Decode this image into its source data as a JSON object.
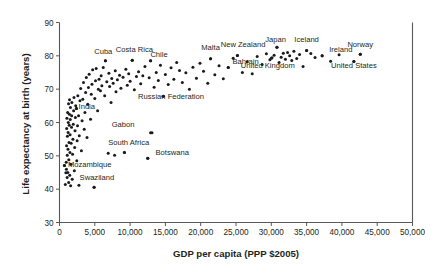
{
  "chart_data": {
    "type": "scatter",
    "title": "",
    "xlabel": "GDP per capita (PPP $2005)",
    "ylabel": "Life expectancy at birth (years)",
    "xlim": [
      0,
      50000
    ],
    "ylim": [
      30,
      90
    ],
    "grid": false,
    "legend": "none",
    "xticks": [
      "0",
      "5,000",
      "10,000",
      "15,000",
      "20,000",
      "25,000",
      "30,000",
      "35,000",
      "40,000",
      "45,000",
      "50,000"
    ],
    "xtickvalues": [
      0,
      5000,
      10000,
      15000,
      20000,
      25000,
      30000,
      35000,
      40000,
      45000,
      50000
    ],
    "yticks": [
      "30",
      "40",
      "50",
      "60",
      "70",
      "80",
      "90"
    ],
    "ytickvalues": [
      30,
      40,
      50,
      60,
      70,
      80,
      90
    ],
    "annotations": [
      {
        "label": "Cuba",
        "x": 6500,
        "y": 78.5,
        "lx": 6200,
        "ly": 80.6,
        "anchor": "middle"
      },
      {
        "label": "Costa Rica",
        "x": 10300,
        "y": 78.7,
        "lx": 10600,
        "ly": 81.3,
        "anchor": "middle"
      },
      {
        "label": "Chile",
        "x": 12900,
        "y": 78.5,
        "lx": 14100,
        "ly": 79.7,
        "anchor": "middle"
      },
      {
        "label": "Malta",
        "x": 21400,
        "y": 79.1,
        "lx": 21400,
        "ly": 81.8,
        "anchor": "middle"
      },
      {
        "label": "New Zealand",
        "x": 25200,
        "y": 80.1,
        "lx": 26000,
        "ly": 82.6,
        "anchor": "middle"
      },
      {
        "label": "Japan",
        "x": 30800,
        "y": 82.6,
        "lx": 30600,
        "ly": 84.3,
        "anchor": "middle"
      },
      {
        "label": "Iceland",
        "x": 35000,
        "y": 81.6,
        "lx": 35000,
        "ly": 84.3,
        "anchor": "middle"
      },
      {
        "label": "Ireland",
        "x": 37200,
        "y": 80.0,
        "lx": 38200,
        "ly": 81.3,
        "anchor": "start"
      },
      {
        "label": "Norway",
        "x": 42600,
        "y": 80.5,
        "lx": 42600,
        "ly": 82.7,
        "anchor": "middle"
      },
      {
        "label": "Bahrain",
        "x": 23900,
        "y": 76.5,
        "lx": 24500,
        "ly": 77.6,
        "anchor": "start"
      },
      {
        "label": "United Kingdom",
        "x": 30000,
        "y": 79.3,
        "lx": 29500,
        "ly": 76.3,
        "anchor": "middle"
      },
      {
        "label": "United States",
        "x": 41700,
        "y": 78.3,
        "lx": 41700,
        "ly": 76.3,
        "anchor": "middle"
      },
      {
        "label": "Russian Federation",
        "x": 14700,
        "y": 67.9,
        "lx": 15800,
        "ly": 67.0,
        "anchor": "middle"
      },
      {
        "label": "India",
        "x": 2400,
        "y": 64.2,
        "lx": 2700,
        "ly": 64.0,
        "anchor": "start"
      },
      {
        "label": "Gabon",
        "x": 12900,
        "y": 56.9,
        "lx": 9000,
        "ly": 58.7,
        "anchor": "middle"
      },
      {
        "label": "South Africa",
        "x": 9200,
        "y": 51.0,
        "lx": 9800,
        "ly": 53.3,
        "anchor": "middle"
      },
      {
        "label": "Botswana",
        "x": 12500,
        "y": 49.3,
        "lx": 13600,
        "ly": 50.3,
        "anchor": "start"
      },
      {
        "label": "Mozambique",
        "x": 700,
        "y": 47.1,
        "lx": 1200,
        "ly": 46.8,
        "anchor": "start"
      },
      {
        "label": "Swaziland",
        "x": 4900,
        "y": 40.6,
        "lx": 5300,
        "ly": 42.7,
        "anchor": "middle"
      }
    ],
    "points": [
      [
        700,
        47.1
      ],
      [
        820,
        41.4
      ],
      [
        900,
        44.9
      ],
      [
        950,
        48.1
      ],
      [
        980,
        46.0
      ],
      [
        1000,
        53.0
      ],
      [
        1020,
        58.2
      ],
      [
        1050,
        61.3
      ],
      [
        1080,
        43.5
      ],
      [
        1100,
        50.2
      ],
      [
        1120,
        55.9
      ],
      [
        1150,
        63.0
      ],
      [
        1180,
        45.0
      ],
      [
        1200,
        52.0
      ],
      [
        1220,
        57.0
      ],
      [
        1250,
        60.0
      ],
      [
        1280,
        65.6
      ],
      [
        1300,
        42.0
      ],
      [
        1320,
        48.8
      ],
      [
        1350,
        54.0
      ],
      [
        1380,
        59.2
      ],
      [
        1400,
        62.5
      ],
      [
        1420,
        66.8
      ],
      [
        1450,
        44.2
      ],
      [
        1480,
        51.0
      ],
      [
        1500,
        56.3
      ],
      [
        1520,
        60.9
      ],
      [
        1550,
        64.5
      ],
      [
        1580,
        41.0
      ],
      [
        1600,
        47.5
      ],
      [
        1650,
        53.8
      ],
      [
        1700,
        58.6
      ],
      [
        1720,
        62.0
      ],
      [
        1750,
        66.0
      ],
      [
        1800,
        43.0
      ],
      [
        1850,
        50.5
      ],
      [
        1900,
        55.0
      ],
      [
        1950,
        59.5
      ],
      [
        2000,
        63.5
      ],
      [
        2050,
        67.5
      ],
      [
        2100,
        45.5
      ],
      [
        2150,
        52.5
      ],
      [
        2200,
        57.5
      ],
      [
        2250,
        61.5
      ],
      [
        2300,
        65.0
      ],
      [
        2400,
        64.2
      ],
      [
        2450,
        48.5
      ],
      [
        2500,
        54.5
      ],
      [
        2550,
        59.0
      ],
      [
        2600,
        68.0
      ],
      [
        2700,
        62.0
      ],
      [
        2750,
        41.2
      ],
      [
        2800,
        56.0
      ],
      [
        2900,
        66.5
      ],
      [
        3000,
        70.2
      ],
      [
        3100,
        51.5
      ],
      [
        3200,
        60.5
      ],
      [
        3300,
        67.0
      ],
      [
        3400,
        72.0
      ],
      [
        3500,
        58.0
      ],
      [
        3600,
        63.0
      ],
      [
        3700,
        69.0
      ],
      [
        3800,
        73.5
      ],
      [
        3900,
        55.5
      ],
      [
        4000,
        65.5
      ],
      [
        4100,
        70.5
      ],
      [
        4200,
        74.5
      ],
      [
        4400,
        61.0
      ],
      [
        4500,
        68.5
      ],
      [
        4600,
        71.5
      ],
      [
        4700,
        75.8
      ],
      [
        4900,
        40.6
      ],
      [
        5000,
        67.2
      ],
      [
        5100,
        72.5
      ],
      [
        5200,
        76.2
      ],
      [
        5400,
        63.5
      ],
      [
        5500,
        70.0
      ],
      [
        5600,
        73.0
      ],
      [
        5800,
        69.5
      ],
      [
        5900,
        74.0
      ],
      [
        6000,
        71.0
      ],
      [
        6200,
        76.5
      ],
      [
        6400,
        68.0
      ],
      [
        6500,
        78.5
      ],
      [
        6700,
        72.2
      ],
      [
        6900,
        50.8
      ],
      [
        7000,
        74.8
      ],
      [
        7100,
        70.8
      ],
      [
        7300,
        66.0
      ],
      [
        7400,
        73.2
      ],
      [
        7600,
        71.8
      ],
      [
        7800,
        50.2
      ],
      [
        7900,
        75.5
      ],
      [
        8000,
        69.2
      ],
      [
        8200,
        72.8
      ],
      [
        8500,
        74.2
      ],
      [
        8700,
        70.3
      ],
      [
        9000,
        73.6
      ],
      [
        9200,
        51.0
      ],
      [
        9400,
        76.0
      ],
      [
        9600,
        71.2
      ],
      [
        9800,
        74.6
      ],
      [
        10000,
        72.4
      ],
      [
        10300,
        78.7
      ],
      [
        10600,
        69.8
      ],
      [
        10900,
        73.8
      ],
      [
        11200,
        75.2
      ],
      [
        11500,
        71.6
      ],
      [
        11800,
        74.0
      ],
      [
        12100,
        76.8
      ],
      [
        12500,
        49.3
      ],
      [
        12700,
        73.4
      ],
      [
        12900,
        78.5
      ],
      [
        13100,
        56.9
      ],
      [
        13400,
        70.6
      ],
      [
        13700,
        75.0
      ],
      [
        14000,
        72.6
      ],
      [
        14300,
        77.2
      ],
      [
        14700,
        67.9
      ],
      [
        15000,
        74.4
      ],
      [
        15400,
        71.4
      ],
      [
        15800,
        76.4
      ],
      [
        16200,
        73.0
      ],
      [
        16600,
        78.0
      ],
      [
        17000,
        75.6
      ],
      [
        17400,
        72.0
      ],
      [
        17900,
        74.9
      ],
      [
        18400,
        70.0
      ],
      [
        18900,
        76.6
      ],
      [
        19400,
        73.3
      ],
      [
        19900,
        77.8
      ],
      [
        20400,
        75.4
      ],
      [
        21000,
        71.8
      ],
      [
        21400,
        79.1
      ],
      [
        22000,
        74.3
      ],
      [
        22600,
        77.0
      ],
      [
        23200,
        73.1
      ],
      [
        23900,
        76.5
      ],
      [
        24600,
        79.3
      ],
      [
        25200,
        80.1
      ],
      [
        25900,
        75.0
      ],
      [
        26600,
        78.2
      ],
      [
        27300,
        74.6
      ],
      [
        28000,
        79.8
      ],
      [
        28700,
        77.4
      ],
      [
        29300,
        80.6
      ],
      [
        29800,
        78.8
      ],
      [
        30100,
        79.4
      ],
      [
        30400,
        80.2
      ],
      [
        30800,
        82.6
      ],
      [
        31100,
        78.0
      ],
      [
        31400,
        79.6
      ],
      [
        31700,
        80.8
      ],
      [
        32000,
        79.0
      ],
      [
        32300,
        81.0
      ],
      [
        32600,
        80.0
      ],
      [
        32900,
        78.6
      ],
      [
        33200,
        81.4
      ],
      [
        33600,
        79.2
      ],
      [
        34000,
        80.4
      ],
      [
        34500,
        76.8
      ],
      [
        35000,
        81.6
      ],
      [
        35600,
        80.7
      ],
      [
        36200,
        79.5
      ],
      [
        37200,
        80.0
      ],
      [
        38400,
        78.4
      ],
      [
        39600,
        80.3
      ],
      [
        41700,
        78.3
      ],
      [
        42600,
        80.5
      ]
    ]
  }
}
